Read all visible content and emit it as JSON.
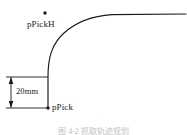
{
  "figure": {
    "caption": "图 4-2  抓取轨迹规划",
    "labels": {
      "pick_high_point": "pPickH",
      "pick_point": "pPick",
      "vertical_offset": "20mm"
    },
    "colors": {
      "stroke": "#1a1a1a",
      "background": "#ffffff",
      "caption": "#8d8d8d"
    },
    "geometry": {
      "pick_point": {
        "x": 48,
        "y": 108
      },
      "pick_high_point": {
        "x": 45,
        "y": 13
      },
      "curve_start": {
        "x": 48,
        "y": 77
      },
      "curve_end": {
        "x": 186,
        "y": 14
      },
      "dimension_line_x": 11,
      "dimension_top_y": 77,
      "dimension_bottom_y": 108,
      "extension_line_left_x": 6
    }
  }
}
